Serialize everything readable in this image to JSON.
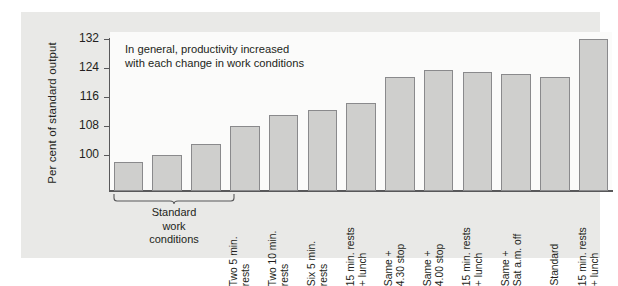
{
  "chart_data": {
    "type": "bar",
    "title": "",
    "annotation": "In general, productivity increased\nwith each change in work conditions",
    "annotation_line1": "In general, productivity increased",
    "annotation_line2": "with each change in work conditions",
    "xlabel": "",
    "ylabel": "Per cent of standard output",
    "ylim": [
      90,
      134
    ],
    "yticks": [
      100,
      108,
      116,
      124,
      132
    ],
    "ytick_labels": [
      "100",
      "108",
      "116",
      "124",
      "132"
    ],
    "grid": false,
    "legend": null,
    "bar_color": "#cfcfcd",
    "bar_edge_color": "#8a8a8c",
    "categories": [
      "Standard",
      "Standard",
      "Standard",
      "Two 5 min.\nrests",
      "Two 10 min.\nrests",
      "Six 5 min.\nrests",
      "15 min. rests\n+ lunch",
      "Same +\n4.30 stop",
      "Same +\n4.00 stop",
      "15 min. rests\n+ lunch",
      "Same +\nSat a.m. off",
      "Standard",
      "15 min. rests\n+ lunch"
    ],
    "values": [
      98,
      100,
      103,
      108,
      111,
      112.5,
      114.5,
      121.5,
      123.5,
      123,
      122.5,
      121.5,
      132
    ],
    "group_brace": {
      "label": "Standard\nwork\nconditions",
      "label_line1": "Standard",
      "label_line2": "work",
      "label_line3": "conditions",
      "covers_bars": [
        1,
        2,
        3
      ]
    }
  }
}
